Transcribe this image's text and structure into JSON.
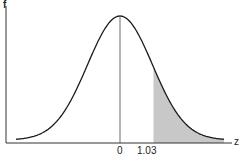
{
  "chart_data": {
    "type": "area",
    "title": "",
    "xlabel": "z",
    "ylabel": "f",
    "x_ticks": [
      {
        "value": 0,
        "label": "0"
      },
      {
        "value": 1.03,
        "label": "1.03"
      }
    ],
    "xlim": [
      -3.2,
      3.2
    ],
    "grid": false,
    "legend": null,
    "series": [
      {
        "name": "f(z)",
        "kind": "normal_pdf",
        "mean": 0,
        "sd": 1
      },
      {
        "name": "shaded tail",
        "from": 1.03,
        "to": 3.2,
        "fill": "#c8c8c8"
      }
    ],
    "annotations": [
      {
        "type": "vertical_line",
        "x": 0
      }
    ]
  },
  "labels": {
    "y_axis": "f",
    "x_axis": "z",
    "tick_0": "0",
    "tick_1": "1.03"
  },
  "colors": {
    "curve": "#1a1a1a",
    "shade": "#c8c8c8",
    "axis": "#333333"
  }
}
